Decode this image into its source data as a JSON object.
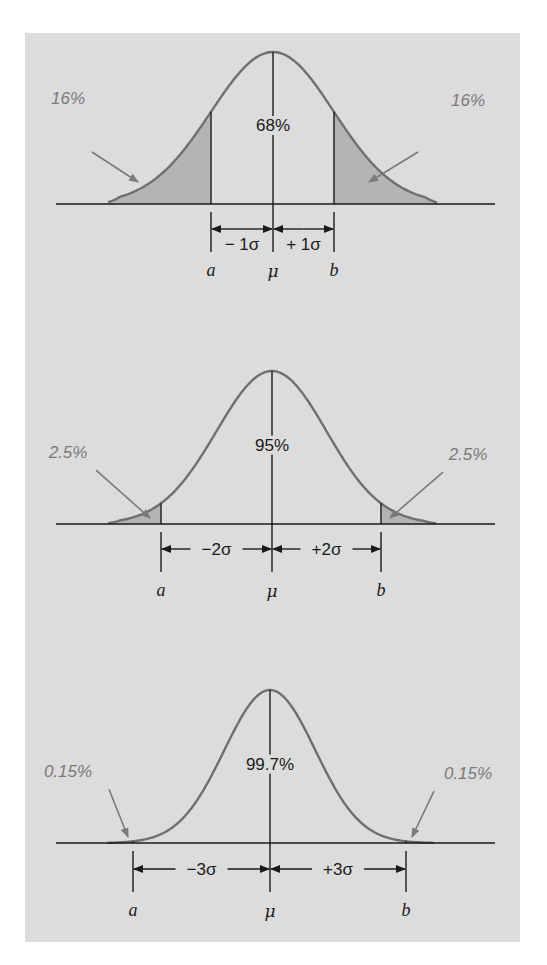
{
  "figure": {
    "colors": {
      "panel_bg": "#dcdcdc",
      "curve": "#6f6f6f",
      "shade": "#b4b4b4",
      "axis": "#1a1a1a",
      "tail_label": "#7a7a7a"
    },
    "panels": [
      {
        "center_label": "68%",
        "left_tail": "16%",
        "right_tail": "16%",
        "minus_sigma": "− 1σ",
        "plus_sigma": "+ 1σ",
        "label_a": "a",
        "label_mu": "μ",
        "label_b": "b",
        "k": 1,
        "geom": {
          "baseline": 204,
          "peak": 52,
          "mu_x": 273,
          "a_x": 211,
          "b_x": 334,
          "tail_l": 108,
          "tail_r": 437,
          "arrow_y": 229,
          "tick_bottom": 252,
          "label_y": 276
        }
      },
      {
        "center_label": "95%",
        "left_tail": "2.5%",
        "right_tail": "2.5%",
        "minus_sigma": "−2σ",
        "plus_sigma": "+2σ",
        "label_a": "a",
        "label_mu": "μ",
        "label_b": "b",
        "k": 2,
        "geom": {
          "baseline": 524,
          "peak": 371,
          "mu_x": 272,
          "a_x": 161,
          "b_x": 381,
          "tail_l": 108,
          "tail_r": 436,
          "arrow_y": 549,
          "tick_bottom": 572,
          "label_y": 596
        }
      },
      {
        "center_label": "99.7%",
        "left_tail": "0.15%",
        "right_tail": "0.15%",
        "minus_sigma": "−3σ",
        "plus_sigma": "+3σ",
        "label_a": "a",
        "label_mu": "μ",
        "label_b": "b",
        "k": 3,
        "geom": {
          "baseline": 843,
          "peak": 690,
          "mu_x": 270,
          "a_x": 133,
          "b_x": 406,
          "tail_l": 107,
          "tail_r": 434,
          "arrow_y": 869,
          "tick_bottom": 892,
          "label_y": 916
        }
      }
    ]
  },
  "chart_data": {
    "type": "area",
    "series": [
      {
        "name": "±1σ",
        "center_percent": 68,
        "each_tail_percent": 16
      },
      {
        "name": "±2σ",
        "center_percent": 95,
        "each_tail_percent": 2.5
      },
      {
        "name": "±3σ",
        "center_percent": 99.7,
        "each_tail_percent": 0.15
      }
    ],
    "x_labels": [
      "a",
      "μ",
      "b"
    ],
    "annotations": [
      "− 1σ",
      "+ 1σ",
      "−2σ",
      "+2σ",
      "−3σ",
      "+3σ"
    ]
  }
}
